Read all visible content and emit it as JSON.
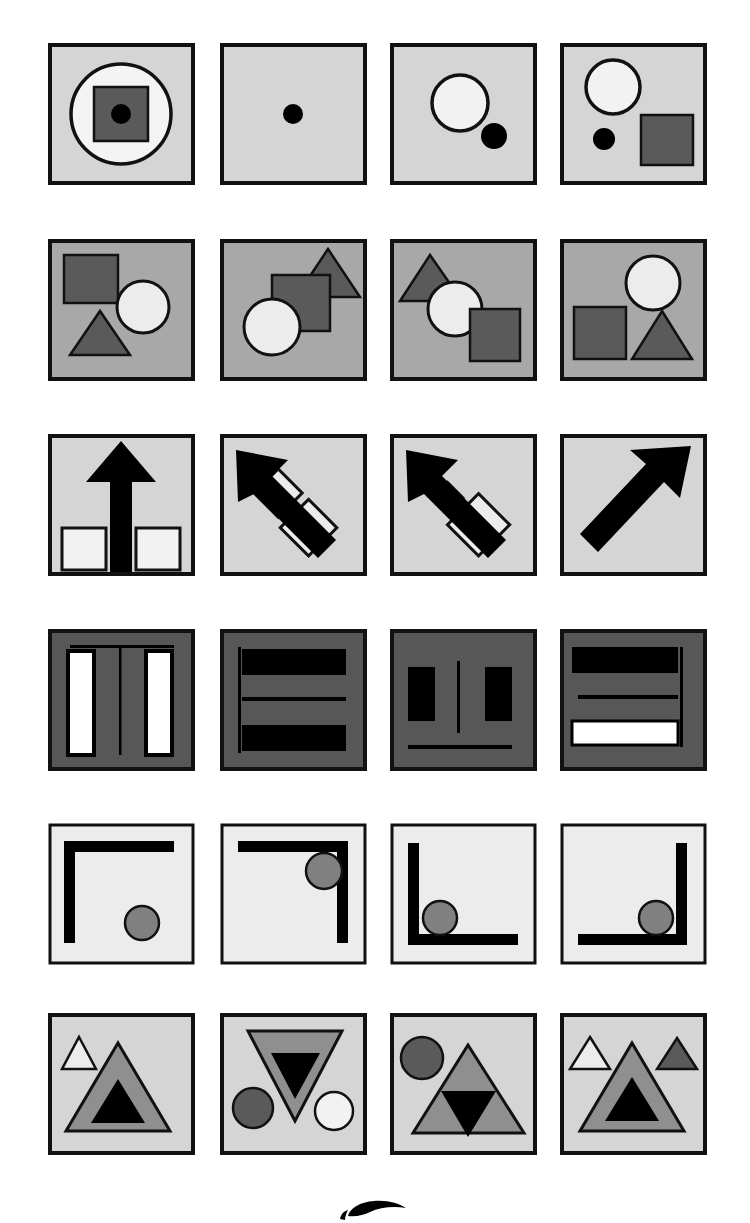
{
  "document": {
    "title": "Abstract Visual Reasoning Figure Panel Sheet",
    "type": "figure-plate",
    "page_background": "#ffffff",
    "grid": {
      "rows": 6,
      "columns": 4,
      "total_panels": 24
    },
    "palette": {
      "outline": "#111111",
      "black": "#000000",
      "white": "#ffffff",
      "panel_light": "#d5d5d5",
      "panel_light_alt": "#d9d9d9",
      "panel_mid": "#a8a8a8",
      "panel_dark": "#575757",
      "shape_dark_gray": "#5a5a5a",
      "shape_mid_gray": "#8f8f8f",
      "shape_light": "#ececec",
      "shape_offwhite": "#f2f2f2"
    }
  },
  "layout": {
    "panel_width": 147,
    "panel_height": 142,
    "column_x": [
      48,
      220,
      390,
      560
    ],
    "row_y": [
      43,
      239,
      434,
      629,
      823,
      1013
    ],
    "border_width": 4
  },
  "panels": [
    {
      "id": "r1c1",
      "row": 1,
      "col": 1,
      "background": "#d5d5d5",
      "description": "Large white circle with black outline containing dark gray square with small black dot at center",
      "shapes": [
        "circle-outline-white",
        "square-dark-gray",
        "dot-black"
      ]
    },
    {
      "id": "r1c2",
      "row": 1,
      "col": 2,
      "background": "#d5d5d5",
      "description": "Single small black dot centered",
      "shapes": [
        "dot-black"
      ]
    },
    {
      "id": "r1c3",
      "row": 1,
      "col": 3,
      "background": "#d5d5d5",
      "description": "Large white circle upper-centre with small black dot lower-right of it",
      "shapes": [
        "circle-white",
        "dot-black"
      ]
    },
    {
      "id": "r1c4",
      "row": 1,
      "col": 4,
      "background": "#d5d5d5",
      "description": "White circle top-left, small black dot lower-left, dark gray square lower-right",
      "shapes": [
        "circle-white",
        "dot-black",
        "square-dark-gray"
      ]
    },
    {
      "id": "r2c1",
      "row": 2,
      "col": 1,
      "background": "#a8a8a8",
      "description": "Dark gray square top-left, white circle right, dark gray triangle bottom-left",
      "shapes": [
        "square-dark-gray",
        "circle-white",
        "triangle-dark-gray"
      ]
    },
    {
      "id": "r2c2",
      "row": 2,
      "col": 2,
      "background": "#a8a8a8",
      "description": "Dark gray triangle top-right overlapped by dark gray square, white circle bottom-left overlapping square",
      "shapes": [
        "triangle-dark-gray",
        "square-dark-gray",
        "circle-white"
      ]
    },
    {
      "id": "r2c3",
      "row": 2,
      "col": 3,
      "background": "#a8a8a8",
      "description": "Dark gray triangle top-left, white circle centre, dark gray square lower-right",
      "shapes": [
        "triangle-dark-gray",
        "circle-white",
        "square-dark-gray"
      ]
    },
    {
      "id": "r2c4",
      "row": 2,
      "col": 4,
      "background": "#a8a8a8",
      "description": "White circle top-right, dark gray square lower-left, dark gray triangle lower-right",
      "shapes": [
        "circle-white",
        "square-dark-gray",
        "triangle-dark-gray"
      ]
    },
    {
      "id": "r3c1",
      "row": 3,
      "col": 1,
      "background": "#d5d5d5",
      "description": "Thick black arrow pointing up, two small light squares at bottom flanking the shaft",
      "shapes": [
        "arrow-up-black",
        "square-light",
        "square-light"
      ]
    },
    {
      "id": "r3c2",
      "row": 3,
      "col": 2,
      "background": "#d5d5d5",
      "description": "Black arrow pointing up-left crossing two light diamonds",
      "shapes": [
        "arrow-upleft-black",
        "diamond-light",
        "diamond-light"
      ]
    },
    {
      "id": "r3c3",
      "row": 3,
      "col": 3,
      "background": "#d5d5d5",
      "description": "Black arrow pointing up-left with one large light diamond and one small light diamond",
      "shapes": [
        "arrow-upleft-black",
        "diamond-light-large",
        "diamond-light-small"
      ]
    },
    {
      "id": "r3c4",
      "row": 3,
      "col": 4,
      "background": "#d5d5d5",
      "description": "Plain black arrow pointing up-right, no diamonds",
      "shapes": [
        "arrow-upright-black"
      ]
    },
    {
      "id": "r4c1",
      "row": 4,
      "col": 1,
      "background": "#575757",
      "description": "Thin black horizontal rule at top, two tall white vertical bars, thin black vertical divider between them",
      "shapes": [
        "rule-horizontal-thin",
        "bar-white-vertical",
        "bar-white-vertical",
        "rule-vertical-thin"
      ]
    },
    {
      "id": "r4c2",
      "row": 4,
      "col": 2,
      "background": "#575757",
      "description": "Thick black horizontal bar top, thin black rule middle, thick black horizontal bar bottom, thin black vertical rule at left",
      "shapes": [
        "bar-black-thick",
        "rule-horizontal-thin",
        "bar-black-thick",
        "rule-vertical-thin"
      ]
    },
    {
      "id": "r4c3",
      "row": 4,
      "col": 3,
      "background": "#575757",
      "description": "Two black vertical blocks flanking a thin vertical rule, thin black horizontal rule near bottom",
      "shapes": [
        "block-black-vertical",
        "rule-vertical-thin",
        "block-black-vertical",
        "rule-horizontal-thin"
      ]
    },
    {
      "id": "r4c4",
      "row": 4,
      "col": 4,
      "background": "#575757",
      "description": "Thick black horizontal bar at top, thin black rule middle, white horizontal bar at bottom, thin black vertical rule at right",
      "shapes": [
        "bar-black-thick",
        "rule-horizontal-thin",
        "bar-white-horizontal",
        "rule-vertical-thin"
      ]
    },
    {
      "id": "r5c1",
      "row": 5,
      "col": 1,
      "background": "#ececec",
      "description": "Thick black bracket open to bottom-right (top and left edges), gray circle lower-right",
      "shapes": [
        "bracket-top-left",
        "circle-gray"
      ]
    },
    {
      "id": "r5c2",
      "row": 5,
      "col": 2,
      "background": "#ececec",
      "description": "Thick black bracket open to bottom-left (top and right edges), gray circle at inner corner",
      "shapes": [
        "bracket-top-right",
        "circle-gray"
      ]
    },
    {
      "id": "r5c3",
      "row": 5,
      "col": 3,
      "background": "#ececec",
      "description": "Thick black bracket open to top-right (left and bottom edges), gray circle in corner",
      "shapes": [
        "bracket-bottom-left",
        "circle-gray"
      ]
    },
    {
      "id": "r5c4",
      "row": 5,
      "col": 4,
      "background": "#ececec",
      "description": "Thick black bracket open to top-left (right and bottom edges), gray circle in corner",
      "shapes": [
        "bracket-bottom-right",
        "circle-gray"
      ]
    },
    {
      "id": "r6c1",
      "row": 6,
      "col": 1,
      "background": "#d5d5d5",
      "description": "Small white triangle upper-left, large gray triangle with black triangle inside",
      "shapes": [
        "triangle-white-small",
        "triangle-gray-large",
        "triangle-black-inner"
      ]
    },
    {
      "id": "r6c2",
      "row": 6,
      "col": 2,
      "background": "#d5d5d5",
      "description": "Large inverted gray triangle with black inverted triangle inside, dark gray circle left, white circle right",
      "shapes": [
        "triangle-gray-inverted",
        "triangle-black-inverted",
        "circle-dark-gray",
        "circle-white"
      ]
    },
    {
      "id": "r6c3",
      "row": 6,
      "col": 3,
      "background": "#d5d5d5",
      "description": "Dark gray circle upper-left, large gray upright triangle containing black inverted triangle",
      "shapes": [
        "circle-dark-gray",
        "triangle-gray-large",
        "triangle-black-inverted"
      ]
    },
    {
      "id": "r6c4",
      "row": 6,
      "col": 4,
      "background": "#d5d5d5",
      "description": "Small white triangle left, large gray triangle with black triangle inside, small dark gray triangle right",
      "shapes": [
        "triangle-white-small",
        "triangle-gray-large",
        "triangle-black-inner",
        "triangle-dark-gray-small"
      ]
    }
  ],
  "footer": {
    "logo_name": "publisher-logo-mark",
    "logo_visible": "partial"
  }
}
